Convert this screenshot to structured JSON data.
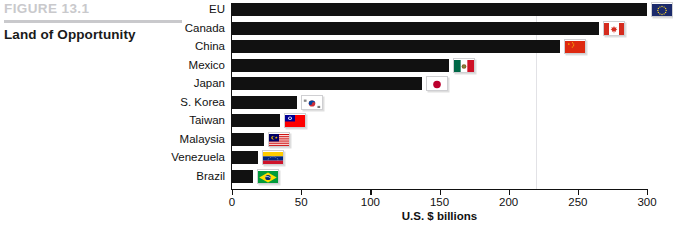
{
  "figure": {
    "number": "FIGURE 13.1",
    "title": "Land of Opportunity"
  },
  "chart_data": {
    "type": "bar",
    "orientation": "horizontal",
    "title": "Land of Opportunity",
    "xlabel": "U.S. $ billions",
    "ylabel": "",
    "xlim": [
      0,
      300
    ],
    "xticks": [
      0,
      50,
      100,
      150,
      200,
      250,
      300
    ],
    "xtick_labels": [
      "0",
      "50",
      "100",
      "150",
      "200",
      "250",
      "300"
    ],
    "grid": false,
    "gridlines_x": [
      220
    ],
    "legend": "none",
    "bar_color": "#111111",
    "categories": [
      "EU",
      "Canada",
      "China",
      "Mexico",
      "Japan",
      "S. Korea",
      "Taiwan",
      "Malaysia",
      "Venezuela",
      "Brazil"
    ],
    "values": [
      300,
      265,
      237,
      157,
      137,
      47,
      35,
      23,
      19,
      15
    ],
    "flags": [
      "EU",
      "Canada",
      "China",
      "Mexico",
      "Japan",
      "S. Korea",
      "Taiwan",
      "Malaysia",
      "Venezuela",
      "Brazil"
    ]
  },
  "axis": {
    "title": "U.S. $ billions"
  }
}
